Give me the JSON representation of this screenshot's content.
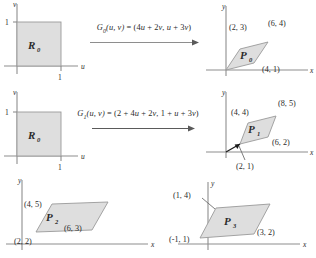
{
  "figure": {
    "fill_color": "#dedede",
    "stroke_color": "#9a9a9a",
    "axis_color": "#8e8e8e"
  },
  "domain_panels": [
    {
      "id": "r0-top",
      "region_label": "R",
      "region_sub": "0",
      "x_axis_label": "u",
      "y_axis_label": "v",
      "x_tick_label": "1",
      "y_tick_label": "1"
    },
    {
      "id": "r0-mid",
      "region_label": "R",
      "region_sub": "0",
      "x_axis_label": "u",
      "y_axis_label": "v",
      "x_tick_label": "1",
      "y_tick_label": "1"
    }
  ],
  "mappings": [
    {
      "id": "map-top",
      "name": "G",
      "sub": "0",
      "args": "(u, v)",
      "equals": "=",
      "image": "(4u + 2v, u + 3v)",
      "full": "G0(u, v) = (4u + 2v, u + 3v)"
    },
    {
      "id": "map-mid",
      "name": "G",
      "sub": "1",
      "args": "(u, v)",
      "equals": "=",
      "image": "(2 + 4u + 2v, 1 + u + 3v)",
      "full": "G1(u, v) = (2 + 4u + 2v, 1 + u + 3v)"
    }
  ],
  "image_panels": [
    {
      "id": "p0",
      "region_label": "P",
      "region_sub": "0",
      "x_axis_label": "x",
      "y_axis_label": "y",
      "vertices": [
        {
          "label": "(2, 3)",
          "x": 2,
          "y": 3
        },
        {
          "label": "(6, 4)",
          "x": 6,
          "y": 4
        },
        {
          "label": "(4, 1)",
          "x": 4,
          "y": 1
        }
      ],
      "unlabeled_vertices": [
        {
          "x": 0,
          "y": 0
        }
      ]
    },
    {
      "id": "p1",
      "region_label": "P",
      "region_sub": "1",
      "x_axis_label": "x",
      "y_axis_label": "y",
      "vertices": [
        {
          "label": "(4, 4)",
          "x": 4,
          "y": 4
        },
        {
          "label": "(8, 5)",
          "x": 8,
          "y": 5
        },
        {
          "label": "(6, 2)",
          "x": 6,
          "y": 2
        },
        {
          "label": "(2, 1)",
          "x": 2,
          "y": 1
        }
      ],
      "has_translation_vector": true
    },
    {
      "id": "p2",
      "region_label": "P",
      "region_sub": "2",
      "x_axis_label": "x",
      "y_axis_label": "y",
      "vertices": [
        {
          "label": "(4, 5)",
          "x": 4,
          "y": 5
        },
        {
          "label": "(6, 3)",
          "x": 6,
          "y": 3
        },
        {
          "label": "(2, 2)",
          "x": 2,
          "y": 2
        }
      ]
    },
    {
      "id": "p3",
      "region_label": "P",
      "region_sub": "3",
      "x_axis_label": "x",
      "y_axis_label": "y",
      "vertices": [
        {
          "label": "(1, 4)",
          "x": 1,
          "y": 4
        },
        {
          "label": "(3, 2)",
          "x": 3,
          "y": 2
        },
        {
          "label": "(-1, 1)",
          "x": -1,
          "y": 1
        }
      ]
    }
  ]
}
